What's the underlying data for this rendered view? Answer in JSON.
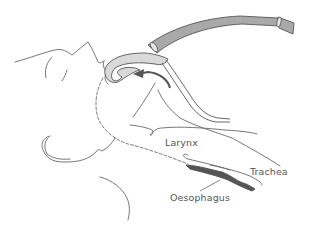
{
  "diagram": {
    "labels": {
      "larynx": "Larynx",
      "trachea": "Trachea",
      "oesophagus": "Oesophagus"
    },
    "colors": {
      "line": "#555555",
      "tube_fill": "#a9a9a9",
      "cuff_fill": "#d9d9d9",
      "oesophagus_fill": "#555555",
      "arrow": "#555555",
      "label": "#555555"
    }
  }
}
